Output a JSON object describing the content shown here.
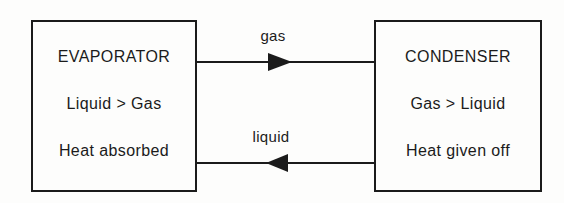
{
  "colors": {
    "background": "#fdfdfc",
    "ink": "#1b1b1b"
  },
  "boxes": [
    {
      "title": "EVAPORATOR",
      "process": "Liquid > Gas",
      "heat": "Heat absorbed"
    },
    {
      "title": "CONDENSER",
      "process": "Gas > Liquid",
      "heat": "Heat given off"
    }
  ],
  "arrows": [
    {
      "label": "gas",
      "direction": "right"
    },
    {
      "label": "liquid",
      "direction": "left"
    }
  ]
}
